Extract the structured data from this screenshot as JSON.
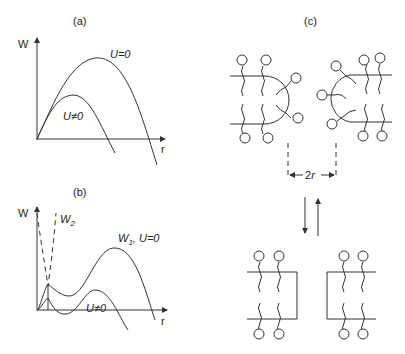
{
  "panels": {
    "a": {
      "label": "(a)",
      "y_axis_label": "W",
      "x_axis_label": "r",
      "curves": [
        {
          "name": "U=0",
          "label": "U=0"
        },
        {
          "name": "U≠0",
          "label": "U≠0"
        }
      ]
    },
    "b": {
      "label": "(b)",
      "y_axis_label": "W",
      "x_axis_label": "r",
      "curves": [
        {
          "name": "W2",
          "label_main": "W",
          "label_sub": "2",
          "style": "dashed"
        },
        {
          "name": "W1, U=0",
          "label_main": "W",
          "label_sub": "1",
          "label_rest": ", U=0"
        },
        {
          "name": "U≠0",
          "label": "U≠0"
        }
      ]
    },
    "c": {
      "label": "(c)",
      "dimension_label": "2r",
      "equilibrium": "reversible arrows (down/up)",
      "top_state": "two curved-headgroup bilayer edges separated by 2r",
      "bottom_state": "two flat bilayer edges"
    }
  }
}
